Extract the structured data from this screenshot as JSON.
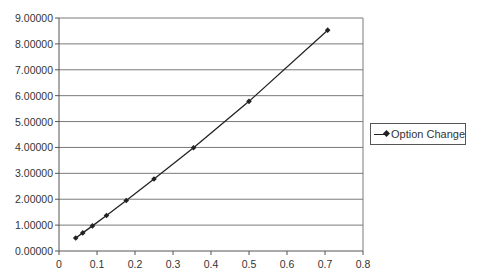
{
  "chart_data": {
    "type": "line",
    "title": "",
    "xlabel": "",
    "ylabel": "",
    "xlim": [
      0,
      0.8
    ],
    "ylim": [
      0,
      9
    ],
    "x_ticks": [
      "0",
      "0.1",
      "0.2",
      "0.3",
      "0.4",
      "0.5",
      "0.6",
      "0.7",
      "0.8"
    ],
    "y_ticks": [
      "0.00000",
      "1.00000",
      "2.00000",
      "3.00000",
      "4.00000",
      "5.00000",
      "6.00000",
      "7.00000",
      "8.00000",
      "9.00000"
    ],
    "grid": {
      "horizontal": true,
      "vertical": false
    },
    "legend_position": "right",
    "series": [
      {
        "name": "Option Change",
        "marker": "diamond",
        "color": "#222222",
        "x": [
          0.044,
          0.0625,
          0.088,
          0.125,
          0.177,
          0.25,
          0.354,
          0.5,
          0.707
        ],
        "values": [
          0.5,
          0.7,
          0.97,
          1.37,
          1.95,
          2.78,
          3.99,
          5.78,
          8.53
        ]
      }
    ]
  },
  "legend": {
    "label": "Option Change"
  }
}
